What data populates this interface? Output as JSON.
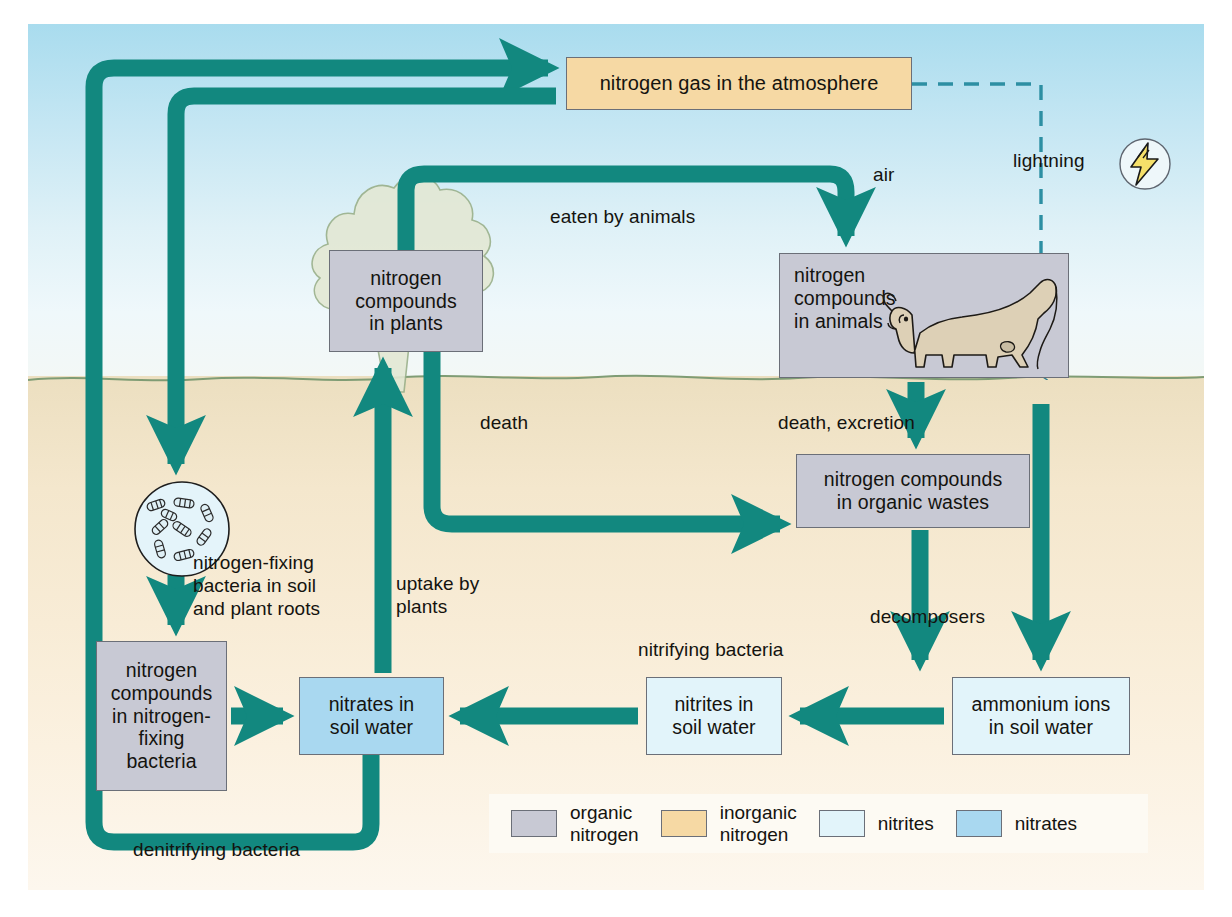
{
  "diagram": {
    "colors": {
      "arrow": "#12887f",
      "organic_nitrogen": "#c8c9d4",
      "inorganic_nitrogen": "#f6d9a4",
      "nitrites": "#e2f4fa",
      "nitrates": "#a9d8f0",
      "sky": "#bfe4f1",
      "soil": "#f4e7cd",
      "lightning_bolt": "#f5e06a"
    }
  },
  "boxes": {
    "atmosphere": "nitrogen gas in the atmosphere",
    "plants": "nitrogen\ncompounds\nin plants",
    "animals": "nitrogen\ncompounds\nin animals",
    "wastes": "nitrogen compounds\nin organic wastes",
    "fixing_bacteria": "nitrogen\ncompounds\nin nitrogen-\nfixing\nbacteria",
    "nitrates": "nitrates in\nsoil water",
    "nitrites": "nitrites in\nsoil water",
    "ammonium": "ammonium ions\nin soil water"
  },
  "labels": {
    "air": "air",
    "lightning": "lightning",
    "eaten_by_animals": "eaten by animals",
    "death": "death",
    "death_excretion": "death, excretion",
    "decomposers": "decomposers",
    "nitrifying_bacteria": "nitrifying bacteria",
    "fixing_bacteria_note": "nitrogen-fixing\nbacteria in soil\nand plant roots",
    "uptake_by_plants": "uptake by\nplants",
    "denitrifying_bacteria": "denitrifying bacteria"
  },
  "legend": {
    "items": [
      {
        "label": "organic\nnitrogen",
        "color": "#c8c9d4"
      },
      {
        "label": "inorganic\nnitrogen",
        "color": "#f6d9a4"
      },
      {
        "label": "nitrites",
        "color": "#e2f4fa"
      },
      {
        "label": "nitrates",
        "color": "#a9d8f0"
      }
    ]
  }
}
